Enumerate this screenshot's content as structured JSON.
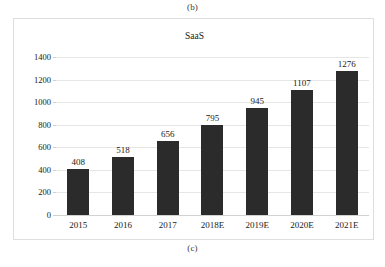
{
  "figure": {
    "caption_top": "(b)",
    "caption_bottom": "(c)"
  },
  "chart_data": {
    "type": "bar",
    "title": "SaaS",
    "xlabel": "",
    "ylabel": "",
    "categories": [
      "2015",
      "2016",
      "2017",
      "2018E",
      "2019E",
      "2020E",
      "2021E"
    ],
    "values": [
      408,
      518,
      656,
      795,
      945,
      1107,
      1276
    ],
    "value_labels": [
      "408",
      "518",
      "656",
      "795",
      "945",
      "1107",
      "1276"
    ],
    "yticks": [
      0,
      200,
      400,
      600,
      800,
      1000,
      1200,
      1400
    ],
    "ytick_labels": [
      "0",
      "200",
      "400",
      "600",
      "800",
      "1000",
      "1200",
      "1400"
    ],
    "ylim": [
      0,
      1400
    ],
    "grid": true,
    "legend": false,
    "bar_color": "#2b2b2b",
    "grid_color": "#e6e6e6",
    "frame_color": "#dedede",
    "background": "#ffffff"
  }
}
